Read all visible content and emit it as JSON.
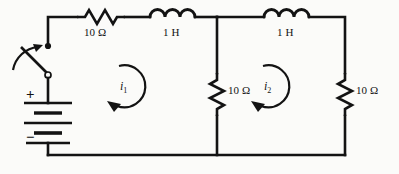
{
  "diagram": {
    "stroke_color": "#131313",
    "background_color": "#fbfbf9",
    "components": {
      "resistor_top_left": {
        "name": "resistor-10-ohm-top-left",
        "label": "10 Ω",
        "value": "10",
        "unit": "Ω",
        "orientation": "horizontal"
      },
      "inductor_top_left": {
        "name": "inductor-1h-top-left",
        "label": "1 H",
        "value": "1",
        "unit": "H",
        "orientation": "horizontal"
      },
      "inductor_top_right": {
        "name": "inductor-1h-top-right",
        "label": "1 H",
        "value": "1",
        "unit": "H",
        "orientation": "horizontal"
      },
      "resistor_middle": {
        "name": "resistor-10-ohm-middle",
        "label": "10 Ω",
        "value": "10",
        "unit": "Ω",
        "orientation": "vertical"
      },
      "resistor_right": {
        "name": "resistor-10-ohm-right",
        "label": "10 Ω",
        "value": "10",
        "unit": "Ω",
        "orientation": "vertical"
      },
      "switch": {
        "name": "switch-open",
        "label": "",
        "state": "open"
      },
      "battery": {
        "name": "battery-dc-source",
        "plus_label": "+",
        "minus_label": "−",
        "cells": 2
      }
    },
    "mesh_currents": [
      {
        "name": "mesh-current-i1",
        "label": "i",
        "subscript": "1",
        "direction": "clockwise"
      },
      {
        "name": "mesh-current-i2",
        "label": "i",
        "subscript": "2",
        "direction": "clockwise"
      }
    ]
  }
}
